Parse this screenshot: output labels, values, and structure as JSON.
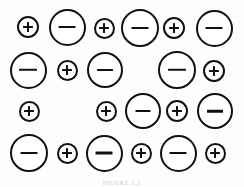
{
  "figure": {
    "background_color": "#fdfdfd",
    "stroke_color": "#111111",
    "fill_color": "#ffffff",
    "caption_text": "FIGURE 1.1",
    "caption_color": "#c9c9c9",
    "width": 244,
    "height": 187,
    "legend": {
      "positive_label": "+",
      "negative_label": "−",
      "positive_name": "cation",
      "negative_name": "anion"
    },
    "ions": [
      {
        "id": "r1c1",
        "charge": "+",
        "label": "+",
        "cx": 28,
        "cy": 27,
        "d": 22,
        "stroke": 2.2,
        "bar_w": 10,
        "bar_h": 2.0,
        "vbar_w": 2.0,
        "vbar_h": 10
      },
      {
        "id": "r1c2",
        "charge": "-",
        "label": "−",
        "cx": 67,
        "cy": 27,
        "d": 37,
        "stroke": 2.4,
        "bar_w": 17,
        "bar_h": 2.2,
        "vbar_w": 0,
        "vbar_h": 0
      },
      {
        "id": "r1c3",
        "charge": "+",
        "label": "+",
        "cx": 104,
        "cy": 28,
        "d": 21,
        "stroke": 2.2,
        "bar_w": 10,
        "bar_h": 2.0,
        "vbar_w": 2.0,
        "vbar_h": 10
      },
      {
        "id": "r1c4",
        "charge": "-",
        "label": "−",
        "cx": 140,
        "cy": 28,
        "d": 38,
        "stroke": 2.4,
        "bar_w": 17,
        "bar_h": 2.2,
        "vbar_w": 0,
        "vbar_h": 0
      },
      {
        "id": "r1c5",
        "charge": "+",
        "label": "+",
        "cx": 174,
        "cy": 28,
        "d": 22,
        "stroke": 2.2,
        "bar_w": 10,
        "bar_h": 2.0,
        "vbar_w": 2.0,
        "vbar_h": 10
      },
      {
        "id": "r1c6",
        "charge": "-",
        "label": "−",
        "cx": 214,
        "cy": 28,
        "d": 37,
        "stroke": 2.4,
        "bar_w": 17,
        "bar_h": 2.2,
        "vbar_w": 0,
        "vbar_h": 0
      },
      {
        "id": "r2c1",
        "charge": "-",
        "label": "−",
        "cx": 28,
        "cy": 70,
        "d": 37,
        "stroke": 2.4,
        "bar_w": 18,
        "bar_h": 2.4,
        "vbar_w": 0,
        "vbar_h": 0
      },
      {
        "id": "r2c2",
        "charge": "+",
        "label": "+",
        "cx": 67,
        "cy": 70,
        "d": 21,
        "stroke": 2.2,
        "bar_w": 10,
        "bar_h": 2.0,
        "vbar_w": 2.0,
        "vbar_h": 10
      },
      {
        "id": "r2c3",
        "charge": "-",
        "label": "−",
        "cx": 105,
        "cy": 70,
        "d": 36,
        "stroke": 2.4,
        "bar_w": 16,
        "bar_h": 2.2,
        "vbar_w": 0,
        "vbar_h": 0
      },
      {
        "id": "r2c4",
        "charge": "-",
        "label": "−",
        "cx": 177,
        "cy": 70,
        "d": 38,
        "stroke": 2.4,
        "bar_w": 18,
        "bar_h": 2.4,
        "vbar_w": 0,
        "vbar_h": 0
      },
      {
        "id": "r2c5",
        "charge": "+",
        "label": "+",
        "cx": 214,
        "cy": 71,
        "d": 22,
        "stroke": 2.2,
        "bar_w": 10,
        "bar_h": 2.0,
        "vbar_w": 2.0,
        "vbar_h": 10
      },
      {
        "id": "r3c1",
        "charge": "+",
        "label": "+",
        "cx": 29,
        "cy": 111,
        "d": 21,
        "stroke": 2.2,
        "bar_w": 10,
        "bar_h": 2.0,
        "vbar_w": 2.0,
        "vbar_h": 10
      },
      {
        "id": "r3c2",
        "charge": "+",
        "label": "+",
        "cx": 106,
        "cy": 111,
        "d": 21,
        "stroke": 2.2,
        "bar_w": 10,
        "bar_h": 2.0,
        "vbar_w": 2.0,
        "vbar_h": 10
      },
      {
        "id": "r3c3",
        "charge": "-",
        "label": "−",
        "cx": 143,
        "cy": 111,
        "d": 36,
        "stroke": 2.0,
        "bar_w": 15,
        "bar_h": 1.8,
        "vbar_w": 0,
        "vbar_h": 0
      },
      {
        "id": "r3c4",
        "charge": "+",
        "label": "+",
        "cx": 177,
        "cy": 111,
        "d": 22,
        "stroke": 2.2,
        "bar_w": 10,
        "bar_h": 2.0,
        "vbar_w": 2.0,
        "vbar_h": 10
      },
      {
        "id": "r3c5",
        "charge": "-",
        "label": "−",
        "cx": 215,
        "cy": 111,
        "d": 36,
        "stroke": 2.4,
        "bar_w": 16,
        "bar_h": 2.6,
        "vbar_w": 0,
        "vbar_h": 0
      },
      {
        "id": "r4c1",
        "charge": "-",
        "label": "−",
        "cx": 29,
        "cy": 153,
        "d": 38,
        "stroke": 2.4,
        "bar_w": 17,
        "bar_h": 2.2,
        "vbar_w": 0,
        "vbar_h": 0
      },
      {
        "id": "r4c2",
        "charge": "+",
        "label": "+",
        "cx": 67,
        "cy": 153,
        "d": 21,
        "stroke": 2.2,
        "bar_w": 10,
        "bar_h": 2.0,
        "vbar_w": 2.0,
        "vbar_h": 10
      },
      {
        "id": "r4c3",
        "charge": "-",
        "label": "−",
        "cx": 104,
        "cy": 153,
        "d": 37,
        "stroke": 2.4,
        "bar_w": 17,
        "bar_h": 2.8,
        "vbar_w": 0,
        "vbar_h": 0
      },
      {
        "id": "r4c4",
        "charge": "+",
        "label": "+",
        "cx": 141,
        "cy": 153,
        "d": 21,
        "stroke": 2.2,
        "bar_w": 10,
        "bar_h": 2.0,
        "vbar_w": 2.0,
        "vbar_h": 10
      },
      {
        "id": "r4c5",
        "charge": "-",
        "label": "−",
        "cx": 178,
        "cy": 153,
        "d": 37,
        "stroke": 2.4,
        "bar_w": 17,
        "bar_h": 2.2,
        "vbar_w": 0,
        "vbar_h": 0
      },
      {
        "id": "r4c6",
        "charge": "+",
        "label": "+",
        "cx": 215,
        "cy": 153,
        "d": 21,
        "stroke": 2.2,
        "bar_w": 10,
        "bar_h": 2.0,
        "vbar_w": 2.0,
        "vbar_h": 10
      }
    ]
  }
}
